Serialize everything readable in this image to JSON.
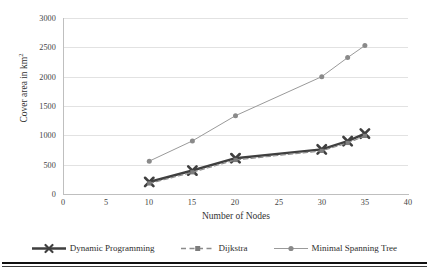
{
  "chart_data": {
    "type": "line",
    "title": "",
    "xlabel": "Number of Nodes",
    "ylabel": "Cover area in km2",
    "ylabel_base": "Cover area in km",
    "ylabel_sup": "2",
    "xlim": [
      0,
      40
    ],
    "ylim": [
      0,
      3000
    ],
    "xticks": [
      0,
      5,
      10,
      15,
      20,
      25,
      30,
      35,
      40
    ],
    "yticks": [
      0,
      500,
      1000,
      1500,
      2000,
      2500,
      3000
    ],
    "grid": "horizontal",
    "legend_position": "bottom",
    "series": [
      {
        "name": "Dynamic Programming",
        "color": "#3f3f3f",
        "marker": "x-bold",
        "linestyle": "solid",
        "linewidth": 2.4,
        "x": [
          10,
          15,
          20,
          30,
          33,
          35
        ],
        "values": [
          205,
          400,
          610,
          760,
          900,
          1030
        ]
      },
      {
        "name": "Dijkstra",
        "color": "#8c8c8c",
        "marker": "square",
        "linestyle": "dashed",
        "linewidth": 1.2,
        "x": [
          10,
          15,
          20,
          30,
          33,
          35
        ],
        "values": [
          180,
          370,
          580,
          735,
          870,
          990
        ]
      },
      {
        "name": "Minimal Spanning Tree",
        "color": "#9a9a9a",
        "marker": "circle",
        "linestyle": "solid",
        "linewidth": 1.0,
        "x": [
          10,
          15,
          20,
          30,
          33,
          35
        ],
        "values": [
          560,
          905,
          1335,
          2000,
          2325,
          2530
        ]
      }
    ]
  },
  "axes": {
    "y_tick_labels": [
      "3000",
      "2500",
      "2000",
      "1500",
      "1000",
      "500",
      "0"
    ],
    "x_tick_labels": [
      "0",
      "5",
      "10",
      "15",
      "20",
      "25",
      "30",
      "35",
      "40"
    ]
  },
  "legend": {
    "items": [
      {
        "label": "Dynamic Programming"
      },
      {
        "label": "Dijkstra"
      },
      {
        "label": "Minimal Spanning Tree"
      }
    ]
  }
}
